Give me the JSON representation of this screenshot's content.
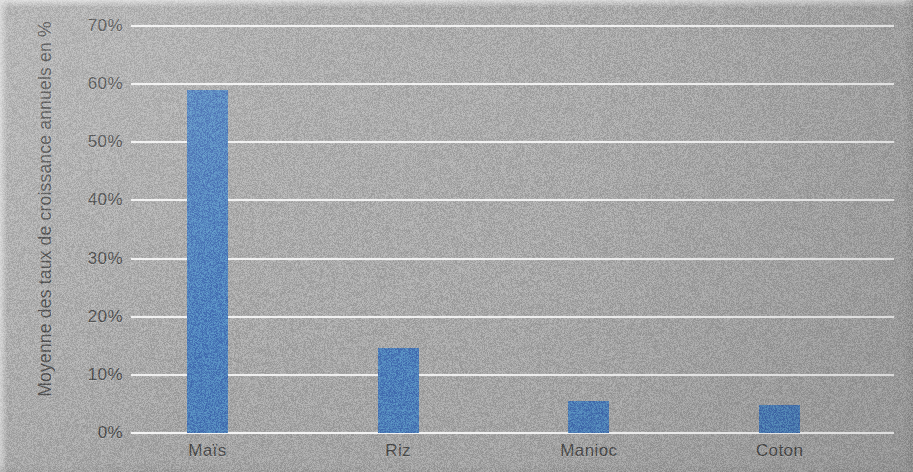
{
  "chart_data": {
    "type": "bar",
    "title": "",
    "subtitle": "",
    "xlabel": "",
    "ylabel": "Moyenne des taux de croissance annuels en %",
    "categories": [
      "Maïs",
      "Riz",
      "Manioc",
      "Coton"
    ],
    "values": [
      59,
      14.6,
      5.5,
      4.8
    ],
    "series": [
      {
        "name": "Moyenne des taux de croissance annuels en %",
        "values": [
          59,
          14.6,
          5.5,
          4.8
        ]
      }
    ],
    "ylim": [
      0,
      70
    ],
    "ytick_values": [
      0,
      10,
      20,
      30,
      40,
      50,
      60,
      70
    ],
    "ytick_labels": [
      "0%",
      "10%",
      "20%",
      "30%",
      "40%",
      "50%",
      "60%",
      "70%"
    ],
    "grid": true,
    "grid_axis": "y",
    "legend": false,
    "legend_position": "none",
    "bar_color": "#4f81bd",
    "gridline_color": "#f9f9f9",
    "plot_background_color": "#a9a9a9",
    "axis_text_color": "#4c4c4c",
    "annotations": []
  },
  "figure": {
    "width": 913,
    "height": 472,
    "background_color": "#a9a9a9"
  }
}
